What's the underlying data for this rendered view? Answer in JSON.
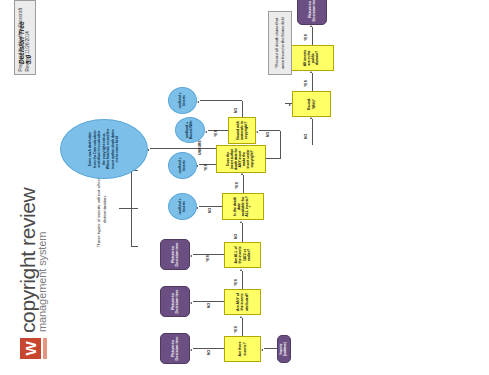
{
  "header": {
    "logo_letter": "W",
    "title_line1": "copyright review",
    "title_line2": "management system",
    "version_badge": "Decision Tree 5.0",
    "prepared_by": "Prepared by Heather Shoecraft",
    "revised": "Revised 11/26/2014"
  },
  "annotations": {
    "bracket_note": "These types of inserts will not affect the determination.",
    "notes_box": "*Record all death dates that were found in the Notes field"
  },
  "nodes": {
    "start": "Inserts (subtree)",
    "q_are_there_inserts": "Are there inserts?",
    "q_any_attributed": "Are ANY of the inserts attributed?",
    "q_all_1872": "Are ALL of the inserts 1872 or earlier?",
    "q_death_date_all": "Is the death date available for ALL inserts?*",
    "q_insert_author_copyright": "Does the insert author death date for ANY insert make the insert under copyright?",
    "q_bound_with_copyright": "Bound with materials in copyright?",
    "q_bound_with": "Bound-With?",
    "q_all_public_domain": "All inserts are in the public domain?",
    "return_1": "Return to Decision tree",
    "return_2": "Return to Decision tree",
    "return_3": "Return to Decision tree",
    "return_4": "Return to Decision tree",
    "ellipse_big": "Enter each death date from the Date calculator and allow it to calculate the copyright status. When finished, record the insert author death dates in the notes field.",
    "ellipse_und_bound": "und/und + Bound With",
    "ellipse_und_inserts_1": "und/und + Inserts",
    "ellipse_und_inserts_2": "und/und + Inserts",
    "ellipse_und_inserts_3": "und/und + Inserts"
  },
  "edge_labels": {
    "e1": "NO",
    "e2": "YES",
    "e3": "NO",
    "e4": "YES",
    "e5": "YES",
    "e6": "NO",
    "e7": "NO",
    "e8": "YES",
    "e9": "UNSURE",
    "e10": "YES",
    "e11": "NO",
    "e12": "YES",
    "e13": "NO",
    "e14": "NO",
    "e15": "YES",
    "e16": "YES"
  },
  "colors": {
    "yellow": "#ffff66",
    "purple": "#6b4f82",
    "blue": "#7cc0ea",
    "gray": "#ebebeb",
    "brand_red": "#c8452f"
  }
}
